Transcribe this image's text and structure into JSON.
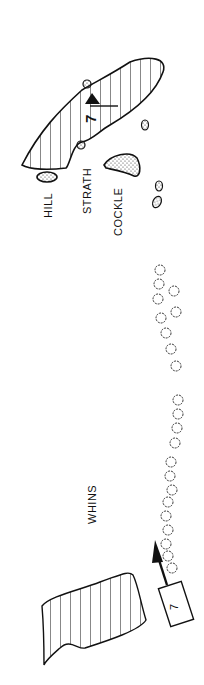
{
  "map": {
    "type": "golf-hole-diagram",
    "hole_number": "7",
    "tee_number": "7",
    "orientation": "rotated-90",
    "labels": {
      "hill": "HILL",
      "strath": "STRATH",
      "cockle": "COCKLE",
      "whins": "WHINS"
    },
    "icons": [
      "flag-icon",
      "tee-box-icon",
      "direction-arrow-icon",
      "bunker-icon",
      "gorse-bush-icon"
    ],
    "colors": {
      "ink": "#111111",
      "background": "#ffffff"
    }
  }
}
